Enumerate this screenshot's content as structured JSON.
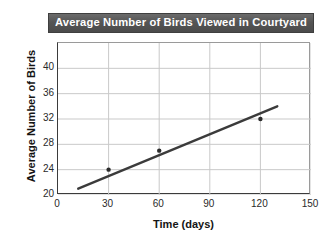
{
  "chart_data": {
    "type": "scatter",
    "title": "Average Number of Birds Viewed in Courtyard",
    "xlabel": "Time (days)",
    "ylabel": "Average Number of Birds",
    "xlim": [
      0,
      150
    ],
    "ylim": [
      20,
      44
    ],
    "grid": true,
    "legend": false,
    "x_ticks": [
      0,
      30,
      60,
      90,
      120,
      150
    ],
    "y_ticks": [
      20,
      24,
      28,
      32,
      36,
      40
    ],
    "x_tick_labels": [
      "0",
      "30",
      "60",
      "90",
      "120",
      "150"
    ],
    "y_tick_labels": [
      "20",
      "24",
      "28",
      "32",
      "36",
      "40"
    ],
    "points": [
      {
        "x": 30,
        "y": 24
      },
      {
        "x": 60,
        "y": 27
      },
      {
        "x": 120,
        "y": 32
      }
    ],
    "series": [
      {
        "name": "trend line",
        "type": "line",
        "x": [
          12,
          130
        ],
        "y": [
          21,
          34
        ]
      }
    ],
    "colors": {
      "line": "#3b3b3b",
      "marker": "#2b2b2b",
      "grid": "#c9c9c9",
      "axis": "#3b3b3b",
      "title_band": "#555555",
      "title_text": "#ffffff"
    }
  },
  "figure": {
    "title": "Average Number of Birds Viewed in Courtyard",
    "x_axis_title": "Time (days)",
    "y_axis_title": "Average Number of Birds"
  }
}
